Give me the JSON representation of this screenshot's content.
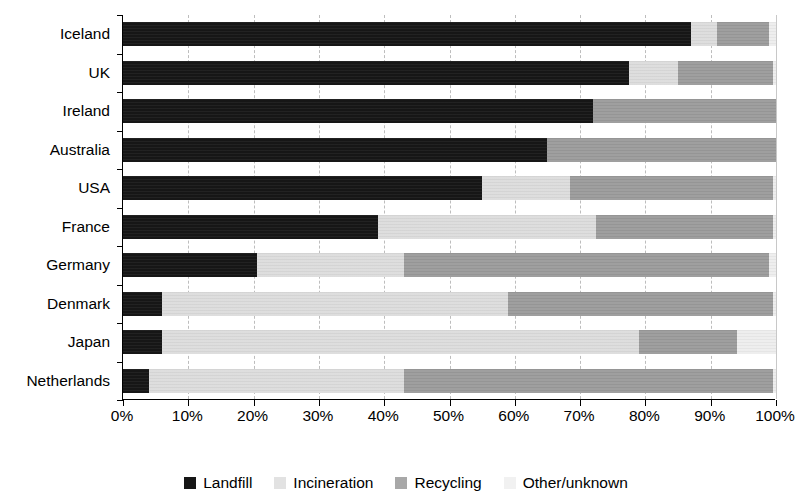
{
  "chart_data": {
    "type": "bar",
    "orientation": "horizontal",
    "stacked": true,
    "normalized": "percent",
    "title": "",
    "subtitle": "",
    "xlabel": "",
    "ylabel": "",
    "xlim": [
      0,
      100
    ],
    "grid": true,
    "legend_position": "bottom",
    "categories": [
      "Iceland",
      "UK",
      "Ireland",
      "Australia",
      "USA",
      "France",
      "Germany",
      "Denmark",
      "Japan",
      "Netherlands"
    ],
    "xtick_labels": [
      "0%",
      "10%",
      "20%",
      "30%",
      "40%",
      "50%",
      "60%",
      "70%",
      "80%",
      "90%",
      "100%"
    ],
    "xtick_values": [
      0,
      10,
      20,
      30,
      40,
      50,
      60,
      70,
      80,
      90,
      100
    ],
    "series": [
      {
        "name": "Landfill",
        "color": "#161616",
        "values": [
          87,
          77.5,
          72,
          65,
          55,
          39,
          20.5,
          6,
          6,
          4
        ]
      },
      {
        "name": "Incineration",
        "color": "#dcdcdc",
        "values": [
          4,
          7.5,
          0,
          0,
          13.5,
          33.5,
          22.5,
          53,
          73,
          39
        ]
      },
      {
        "name": "Recycling",
        "color": "#9a9a9a",
        "values": [
          8,
          14.5,
          28,
          35,
          31,
          27,
          56,
          40.5,
          15,
          56.5
        ]
      },
      {
        "name": "Other/unknown",
        "color": "#ededed",
        "values": [
          1,
          0.5,
          0,
          0,
          0.5,
          0.5,
          1,
          0.5,
          6,
          0.5
        ]
      }
    ]
  },
  "legend": {
    "items": [
      {
        "label": "Landfill",
        "key": "landfill"
      },
      {
        "label": "Incineration",
        "key": "incineration"
      },
      {
        "label": "Recycling",
        "key": "recycling"
      },
      {
        "label": "Other/unknown",
        "key": "other"
      }
    ]
  }
}
